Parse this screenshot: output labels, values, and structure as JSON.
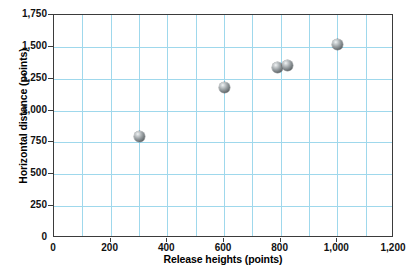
{
  "chart_data": {
    "type": "scatter",
    "title": "",
    "xlabel": "Release heights (points)",
    "ylabel": "Horizontal distance (points)",
    "xlim": [
      0,
      1200
    ],
    "ylim": [
      0,
      1750
    ],
    "grid": true,
    "grid_x_step": 100,
    "grid_y_step": 250,
    "legend": "none",
    "x_tick_labels": [
      "0",
      "200",
      "400",
      "600",
      "800",
      "1,000",
      "1,200"
    ],
    "x_tick_values": [
      0,
      200,
      400,
      600,
      800,
      1000,
      1200
    ],
    "y_tick_labels": [
      "0",
      "250",
      "500",
      "750",
      "1,000",
      "1,250",
      "1,500",
      "1,750"
    ],
    "y_tick_values": [
      0,
      250,
      500,
      750,
      1000,
      1250,
      1500,
      1750
    ],
    "series": [
      {
        "name": "observations",
        "marker": "sphere",
        "color": "#8a9093",
        "points": [
          {
            "x": 300,
            "y": 800
          },
          {
            "x": 600,
            "y": 1180
          },
          {
            "x": 790,
            "y": 1340
          },
          {
            "x": 825,
            "y": 1350
          },
          {
            "x": 1000,
            "y": 1515
          }
        ]
      }
    ]
  },
  "colors": {
    "grid": "#9fd8ec",
    "axis": "#3b3b3b",
    "text": "#111111",
    "background": "#ffffff",
    "marker": "#8a9093"
  }
}
